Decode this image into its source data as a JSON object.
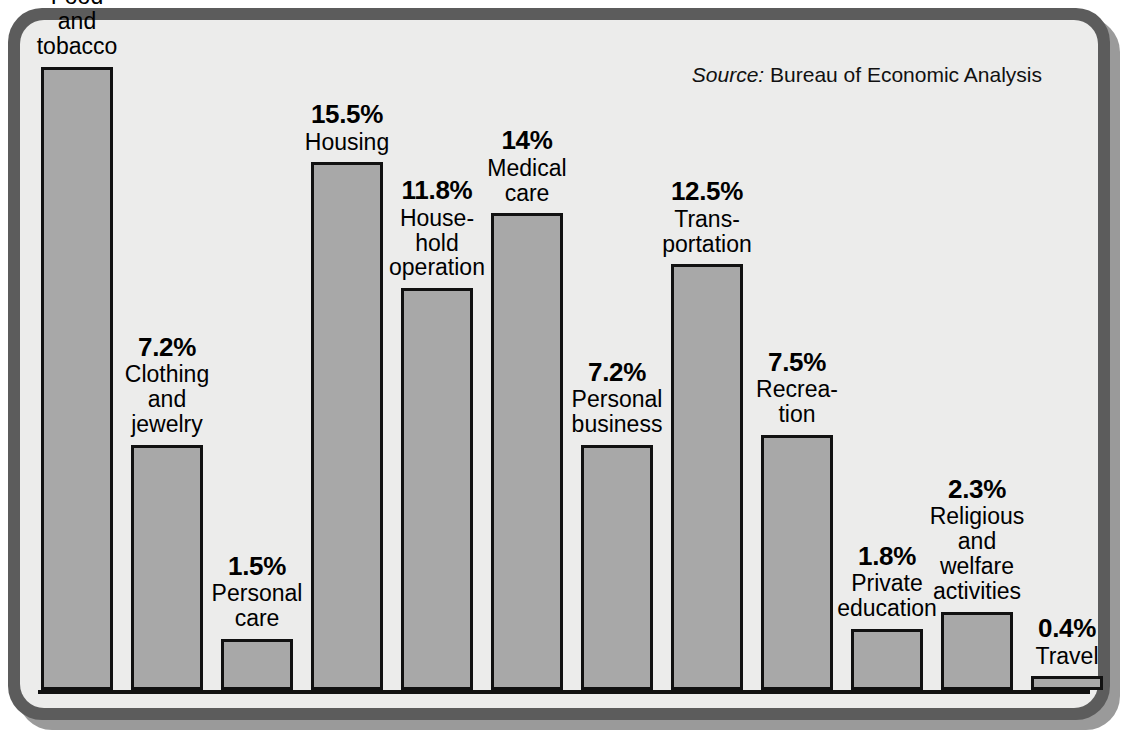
{
  "chart_data": {
    "type": "bar",
    "title": "",
    "subtitle": "",
    "xlabel": "",
    "ylabel": "",
    "ylim": [
      0,
      19.4
    ],
    "grid": false,
    "legend": "none",
    "value_suffix": "%",
    "categories": [
      "Food and tobacco",
      "Clothing and jewelry",
      "Personal care",
      "Housing",
      "Household operation",
      "Medical care",
      "Personal business",
      "Transportation",
      "Recreation",
      "Private education",
      "Religious and welfare activities",
      "Travel"
    ],
    "values": [
      18.3,
      7.2,
      1.5,
      15.5,
      11.8,
      14,
      7.2,
      12.5,
      7.5,
      1.8,
      2.3,
      0.4
    ],
    "value_labels": [
      "18.3%",
      "7.2%",
      "1.5%",
      "15.5%",
      "11.8%",
      "14%",
      "7.2%",
      "12.5%",
      "7.5%",
      "1.8%",
      "2.3%",
      "0.4%"
    ],
    "bars": [
      {
        "id": "food-and-tobacco",
        "pct": "18.3%",
        "value": 18.3,
        "name_lines": [
          "Food",
          "and",
          "tobacco"
        ]
      },
      {
        "id": "clothing-and-jewelry",
        "pct": "7.2%",
        "value": 7.2,
        "name_lines": [
          "Clothing",
          "and",
          "jewelry"
        ]
      },
      {
        "id": "personal-care",
        "pct": "1.5%",
        "value": 1.5,
        "name_lines": [
          "Personal",
          "care"
        ]
      },
      {
        "id": "housing",
        "pct": "15.5%",
        "value": 15.5,
        "name_lines": [
          "Housing"
        ]
      },
      {
        "id": "household-operation",
        "pct": "11.8%",
        "value": 11.8,
        "name_lines": [
          "House-",
          "hold",
          "operation"
        ]
      },
      {
        "id": "medical-care",
        "pct": "14%",
        "value": 14,
        "name_lines": [
          "Medical",
          "care"
        ]
      },
      {
        "id": "personal-business",
        "pct": "7.2%",
        "value": 7.2,
        "name_lines": [
          "Personal",
          "business"
        ]
      },
      {
        "id": "transportation",
        "pct": "12.5%",
        "value": 12.5,
        "name_lines": [
          "Trans-",
          "portation"
        ]
      },
      {
        "id": "recreation",
        "pct": "7.5%",
        "value": 7.5,
        "name_lines": [
          "Recrea-",
          "tion"
        ]
      },
      {
        "id": "private-education",
        "pct": "1.8%",
        "value": 1.8,
        "name_lines": [
          "Private",
          "education"
        ]
      },
      {
        "id": "religious-and-welfare",
        "pct": "2.3%",
        "value": 2.3,
        "name_lines": [
          "Religious",
          "and",
          "welfare",
          "activities"
        ]
      },
      {
        "id": "travel",
        "pct": "0.4%",
        "value": 0.4,
        "name_lines": [
          "Travel"
        ]
      }
    ],
    "colors": {
      "bar_fill": "#a8a8a8",
      "bar_stroke": "#111111",
      "plot_background": "#ececeb",
      "frame": "#5c5c5c",
      "frame_shadow": "#9a9a9a",
      "text": "#000000"
    }
  },
  "source": {
    "lead": "Source:",
    "text": " Bureau of Economic Analysis"
  }
}
